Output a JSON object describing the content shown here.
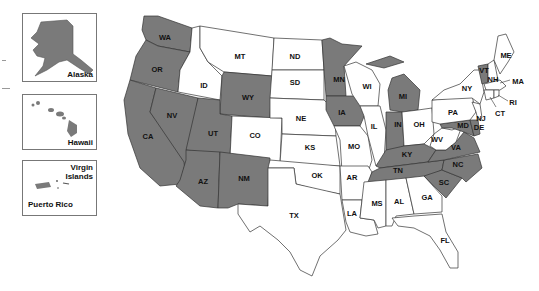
{
  "colors": {
    "shaded": "#7a7a7a",
    "unshaded": "#ffffff",
    "border": "#333333"
  },
  "insets": [
    {
      "name": "Alaska",
      "label": "Alaska",
      "shaded": true
    },
    {
      "name": "Hawaii",
      "label": "Hawaii",
      "shaded": true
    },
    {
      "name": "Puerto Rico",
      "label": "Puerto Rico",
      "shaded": true
    },
    {
      "name": "Virgin Islands",
      "label": "Virgin Islands",
      "shaded": false
    }
  ],
  "states": {
    "WA": {
      "label": "WA",
      "shaded": true
    },
    "OR": {
      "label": "OR",
      "shaded": true
    },
    "CA": {
      "label": "CA",
      "shaded": true
    },
    "NV": {
      "label": "NV",
      "shaded": true
    },
    "ID": {
      "label": "ID",
      "shaded": false
    },
    "MT": {
      "label": "MT",
      "shaded": false
    },
    "WY": {
      "label": "WY",
      "shaded": true
    },
    "UT": {
      "label": "UT",
      "shaded": true
    },
    "CO": {
      "label": "CO",
      "shaded": false
    },
    "AZ": {
      "label": "AZ",
      "shaded": true
    },
    "NM": {
      "label": "NM",
      "shaded": true
    },
    "ND": {
      "label": "ND",
      "shaded": false
    },
    "SD": {
      "label": "SD",
      "shaded": false
    },
    "NE": {
      "label": "NE",
      "shaded": false
    },
    "KS": {
      "label": "KS",
      "shaded": false
    },
    "OK": {
      "label": "OK",
      "shaded": false
    },
    "TX": {
      "label": "TX",
      "shaded": false
    },
    "MN": {
      "label": "MN",
      "shaded": true
    },
    "IA": {
      "label": "IA",
      "shaded": true
    },
    "MO": {
      "label": "MO",
      "shaded": false
    },
    "AR": {
      "label": "AR",
      "shaded": false
    },
    "LA": {
      "label": "LA",
      "shaded": false
    },
    "WI": {
      "label": "WI",
      "shaded": false
    },
    "IL": {
      "label": "IL",
      "shaded": false
    },
    "MI": {
      "label": "MI",
      "shaded": true
    },
    "IN": {
      "label": "IN",
      "shaded": true
    },
    "OH": {
      "label": "OH",
      "shaded": false
    },
    "KY": {
      "label": "KY",
      "shaded": true
    },
    "TN": {
      "label": "TN",
      "shaded": true
    },
    "MS": {
      "label": "MS",
      "shaded": false
    },
    "AL": {
      "label": "AL",
      "shaded": false
    },
    "GA": {
      "label": "GA",
      "shaded": false
    },
    "FL": {
      "label": "FL",
      "shaded": false
    },
    "SC": {
      "label": "SC",
      "shaded": true
    },
    "NC": {
      "label": "NC",
      "shaded": true
    },
    "VA": {
      "label": "VA",
      "shaded": true
    },
    "WV": {
      "label": "WV",
      "shaded": false
    },
    "PA": {
      "label": "PA",
      "shaded": false
    },
    "NY": {
      "label": "NY",
      "shaded": false
    },
    "MD": {
      "label": "MD",
      "shaded": true
    },
    "DE": {
      "label": "DE",
      "shaded": true
    },
    "NJ": {
      "label": "NJ",
      "shaded": false
    },
    "CT": {
      "label": "CT",
      "shaded": false
    },
    "RI": {
      "label": "RI",
      "shaded": false
    },
    "MA": {
      "label": "MA",
      "shaded": false
    },
    "VT": {
      "label": "VT",
      "shaded": true
    },
    "NH": {
      "label": "NH",
      "shaded": false
    },
    "ME": {
      "label": "ME",
      "shaded": false
    }
  }
}
